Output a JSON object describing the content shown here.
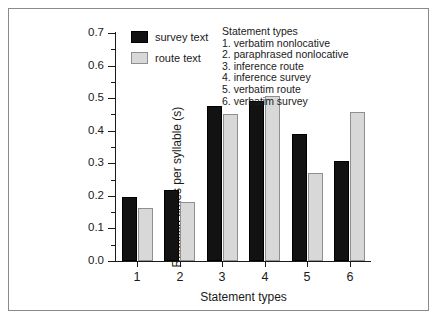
{
  "chart_data": {
    "type": "bar",
    "title": "",
    "xlabel": "Statement types",
    "ylabel": "Reaction times per syllable (s)",
    "categories": [
      "1",
      "2",
      "3",
      "4",
      "5",
      "6"
    ],
    "ylim": [
      0.0,
      0.7
    ],
    "ytick_labels": [
      "0.0",
      "0.1",
      "0.2",
      "0.3",
      "0.4",
      "0.5",
      "0.6",
      "0.7"
    ],
    "ytick_values": [
      0.0,
      0.1,
      0.2,
      0.3,
      0.4,
      0.5,
      0.6,
      0.7
    ],
    "yminor_values": [
      0.05,
      0.15,
      0.25,
      0.35,
      0.45,
      0.55,
      0.65
    ],
    "grid": false,
    "legend_position": "top-left-inside",
    "series": [
      {
        "name": "survey text",
        "color": "#121212",
        "values": [
          0.198,
          0.218,
          0.476,
          0.492,
          0.39,
          0.307
        ]
      },
      {
        "name": "route text",
        "color": "#d8d8d8",
        "values": [
          0.163,
          0.181,
          0.451,
          0.507,
          0.27,
          0.458
        ]
      }
    ],
    "annotation": {
      "title": "Statement types",
      "items": [
        "1. verbatim nonlocative",
        "2. paraphrased nonlocative",
        "3. inference route",
        "4. inference survey",
        "5. verbatim route",
        "6. verbatim survey"
      ]
    }
  },
  "axes": {
    "y_title": "Reaction times per syllable (s)",
    "x_title": "Statement types"
  },
  "legend": {
    "items": [
      {
        "label": "survey text",
        "swatch": "black-filled-square"
      },
      {
        "label": "route text",
        "swatch": "light-gray-square"
      }
    ]
  },
  "colors": {
    "survey_bar": "#121212",
    "route_bar": "#d8d8d8",
    "route_bar_edge": "#8f8f8f",
    "axis": "#1a1a1a",
    "frame": "#8a8a8a",
    "background": "#ffffff"
  }
}
